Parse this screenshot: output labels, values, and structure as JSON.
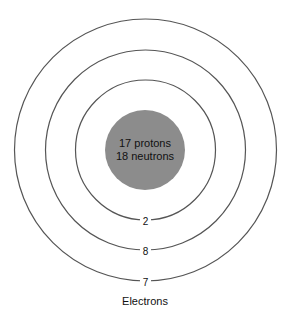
{
  "diagram": {
    "nucleus": {
      "line1": "17 protons",
      "line2": "18 neutrons",
      "color": "#8c8c8c"
    },
    "shells": [
      {
        "electrons": "2"
      },
      {
        "electrons": "8"
      },
      {
        "electrons": "7"
      }
    ],
    "caption": "Electrons"
  }
}
